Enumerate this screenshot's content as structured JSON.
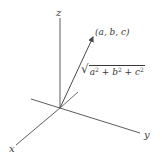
{
  "diagram": {
    "type": "3d-coordinate-axes-with-vector",
    "axes": {
      "z": {
        "label": "z"
      },
      "y": {
        "label": "y"
      },
      "x": {
        "label": "x"
      }
    },
    "vector": {
      "point_label": "(a, b, c)",
      "magnitude_label": {
        "sqrt_symbol": "√",
        "a": "a",
        "b": "b",
        "c": "c",
        "exp": "2",
        "plus": " + "
      }
    },
    "colors": {
      "line": "#4a4a4a",
      "text": "#3a3a3a",
      "background": "#ffffff"
    }
  }
}
